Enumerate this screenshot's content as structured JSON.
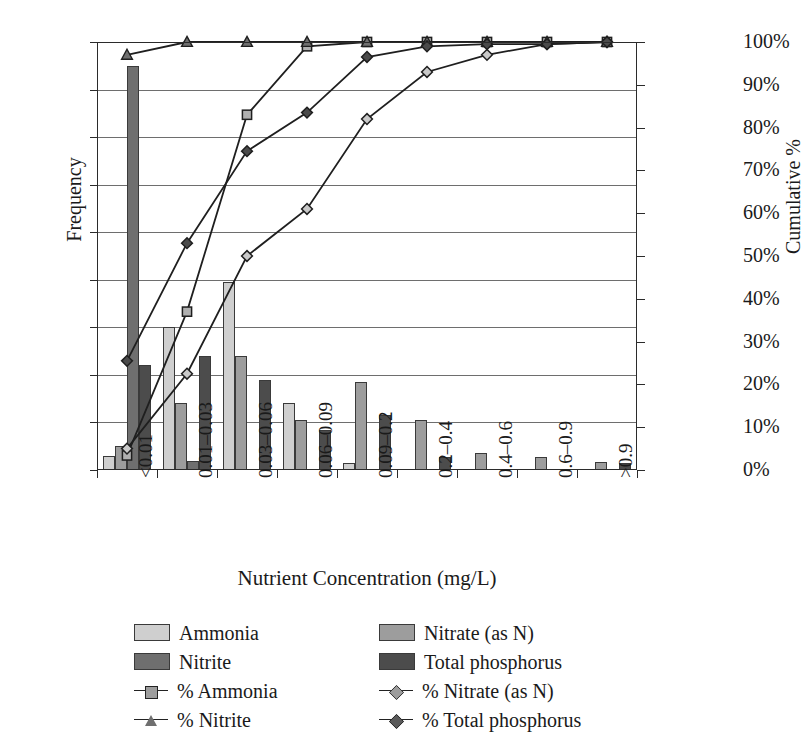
{
  "chart_data": {
    "type": "bar",
    "title": "",
    "subtitle": "",
    "xlabel": "Nutrient Concentration (mg/L)",
    "ylabel": "Frequency",
    "y2label": "Cumulative %",
    "categories": [
      "<0.01",
      "0.01–0.03",
      "0.03–0.06",
      "0.06–0.09",
      "0.09–0.2",
      "0.2–0.4",
      "0.4–0.6",
      "0.6–0.9",
      ">0.9"
    ],
    "ylim": [
      0,
      90
    ],
    "yticks": [
      0,
      10,
      20,
      30,
      40,
      50,
      60,
      70,
      80,
      90
    ],
    "ytick_labels": [
      "0",
      "10",
      "20",
      "30",
      "40",
      "50",
      "60",
      "70",
      "80",
      "90"
    ],
    "y2lim": [
      0,
      100
    ],
    "y2ticks": [
      0,
      10,
      20,
      30,
      40,
      50,
      60,
      70,
      80,
      90,
      100
    ],
    "y2tick_labels": [
      "0%",
      "10%",
      "20%",
      "30%",
      "40%",
      "50%",
      "60%",
      "70%",
      "80%",
      "90%",
      "100%"
    ],
    "grid": true,
    "legend_position": "below",
    "bar_series": [
      {
        "name": "Ammonia",
        "color": "#cfcfcf",
        "values": [
          3,
          30,
          39.5,
          14,
          1.5,
          0,
          0,
          0,
          0
        ]
      },
      {
        "name": "Nitrate (as N)",
        "color": "#9d9d9d",
        "values": [
          5,
          14,
          24,
          10.5,
          18.5,
          10.5,
          3.5,
          2.8,
          1.6
        ]
      },
      {
        "name": "Nitrite",
        "color": "#6f6f6f",
        "values": [
          85,
          2,
          0,
          0,
          0,
          0,
          0,
          0,
          0
        ]
      },
      {
        "name": "Total phosphorus",
        "color": "#4c4c4c",
        "values": [
          22,
          24,
          19,
          8.5,
          11.5,
          2.7,
          0,
          0,
          1.5
        ]
      }
    ],
    "line_series": [
      {
        "name": "% Ammonia",
        "marker": "square",
        "values": [
          3.4,
          37,
          83,
          99,
          100,
          100,
          100,
          100,
          100
        ]
      },
      {
        "name": "% Nitrate (as N)",
        "marker": "open-diamond",
        "values": [
          5,
          22.5,
          50,
          61,
          82,
          93,
          97,
          99.5,
          100
        ]
      },
      {
        "name": "% Nitrite",
        "marker": "triangle",
        "values": [
          97,
          100,
          100,
          100,
          100,
          100,
          100,
          100,
          100
        ]
      },
      {
        "name": "% Total phosphorus",
        "marker": "filled-diamond",
        "values": [
          25.5,
          53,
          74.5,
          83.5,
          96.5,
          99,
          99.5,
          99.5,
          100
        ]
      }
    ]
  },
  "legend": {
    "items": [
      {
        "label": "Ammonia",
        "kind": "swatch",
        "color": "#cfcfcf"
      },
      {
        "label": "Nitrate (as N)",
        "kind": "swatch",
        "color": "#9d9d9d"
      },
      {
        "label": "Nitrite",
        "kind": "swatch",
        "color": "#6f6f6f"
      },
      {
        "label": "Total phosphorus",
        "kind": "swatch",
        "color": "#4c4c4c"
      },
      {
        "label": "% Ammonia",
        "kind": "line",
        "marker": "square"
      },
      {
        "label": "% Nitrate (as N)",
        "kind": "line",
        "marker": "open-diamond"
      },
      {
        "label": "% Nitrite",
        "kind": "line",
        "marker": "triangle"
      },
      {
        "label": "% Total phosphorus",
        "kind": "line",
        "marker": "filled-diamond"
      }
    ]
  }
}
